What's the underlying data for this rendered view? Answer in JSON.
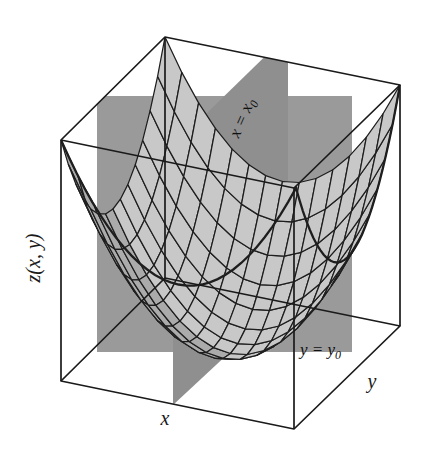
{
  "figure": {
    "kind": "3d-surface-plot",
    "background_color": "#ffffff",
    "box_line_color": "#1a1a1a",
    "plane_color": "#9a9a9a",
    "plane_color_dark": "#8a8a8a",
    "surface_fill": "#c8c8c8",
    "surface_fill_shaded": "#ababab",
    "mesh_line_color": "#1e1e1e"
  },
  "labels": {
    "z_axis": "z(x, y)",
    "x_axis": "x",
    "y_axis": "y",
    "plane_x": "x = x",
    "plane_x_sub": "0",
    "plane_y": "y = y",
    "plane_y_sub": "0"
  },
  "chart_data": {
    "type": "surface",
    "title": "",
    "xlabel": "x",
    "ylabel": "y",
    "zlabel": "z(x, y)",
    "function": "z = a*(x-x0)^2 + b*(y-y0)^2",
    "grid": true,
    "legend": "none",
    "xlim": [
      -1,
      1
    ],
    "ylim": [
      -1,
      1
    ],
    "zlim": [
      0,
      1
    ],
    "section_planes": [
      {
        "label": "x = x0",
        "orientation": "vertical",
        "constant_axis": "x",
        "value": "x0"
      },
      {
        "label": "y = y0",
        "orientation": "vertical",
        "constant_axis": "y",
        "value": "y0"
      }
    ],
    "mesh_divisions_u": 14,
    "mesh_divisions_v": 14,
    "annotations": [
      "x = x0",
      "y = y0"
    ]
  }
}
